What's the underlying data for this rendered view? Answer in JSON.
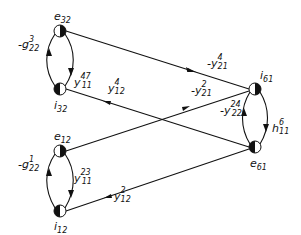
{
  "diagram": {
    "type": "signal-flow-graph",
    "nodes": [
      {
        "id": "e32",
        "label": "e",
        "sub": "32",
        "x": 60,
        "y": 31,
        "filled_half": "right"
      },
      {
        "id": "i32",
        "label": "i",
        "sub": "32",
        "x": 60,
        "y": 89,
        "filled_half": "left"
      },
      {
        "id": "e12",
        "label": "e",
        "sub": "12",
        "x": 60,
        "y": 151,
        "filled_half": "right"
      },
      {
        "id": "i12",
        "label": "i",
        "sub": "12",
        "x": 60,
        "y": 211,
        "filled_half": "left"
      },
      {
        "id": "i61",
        "label": "i",
        "sub": "61",
        "x": 255,
        "y": 89,
        "filled_half": "right"
      },
      {
        "id": "e61",
        "label": "e",
        "sub": "61",
        "x": 255,
        "y": 147,
        "filled_half": "left"
      }
    ],
    "edges": [
      {
        "from": "i32",
        "to": "e32",
        "gain": "-g",
        "sup": "3",
        "sub": "22"
      },
      {
        "from": "e32",
        "to": "i32",
        "gain": "y",
        "sup": "47",
        "sub": "11"
      },
      {
        "from": "i12",
        "to": "e12",
        "gain": "-g",
        "sup": "1",
        "sub": "22"
      },
      {
        "from": "e12",
        "to": "i12",
        "gain": "y",
        "sup": "23",
        "sub": "11"
      },
      {
        "from": "e61",
        "to": "i61",
        "gain": "-y",
        "sup": "24",
        "sub": "22"
      },
      {
        "from": "i61",
        "to": "e61",
        "gain": "h",
        "sup": "6",
        "sub": "11"
      },
      {
        "from": "e32",
        "to": "i61",
        "gain": "-y",
        "sup": "4",
        "sub": "21"
      },
      {
        "from": "e12",
        "to": "i61",
        "gain": "-y",
        "sup": "2",
        "sub": "21"
      },
      {
        "from": "e61",
        "to": "i32",
        "gain": "y",
        "sup": "4",
        "sub": "12"
      },
      {
        "from": "e61",
        "to": "i12",
        "gain": "y",
        "sup": "2",
        "sub": "12"
      }
    ]
  },
  "labels": {
    "n_e32": {
      "main": "e",
      "sub": "32"
    },
    "n_i32": {
      "main": "i",
      "sub": "32"
    },
    "n_e12": {
      "main": "e",
      "sub": "12"
    },
    "n_i12": {
      "main": "i",
      "sub": "12"
    },
    "n_i61": {
      "main": "i",
      "sub": "61"
    },
    "n_e61": {
      "main": "e",
      "sub": "61"
    },
    "g22_3": {
      "main": "-g",
      "sup": "3",
      "sub": "22"
    },
    "y11_47": {
      "main": "y",
      "sup": "47",
      "sub": "11"
    },
    "y12_4": {
      "main": "y",
      "sup": "4",
      "sub": "12"
    },
    "y21_4": {
      "main": "-y",
      "sup": "4",
      "sub": "21"
    },
    "y21_2": {
      "main": "-y",
      "sup": "2",
      "sub": "21"
    },
    "y22_24": {
      "main": "-y",
      "sup": "24",
      "sub": "22"
    },
    "h11_6": {
      "main": "h",
      "sup": "6",
      "sub": "11"
    },
    "g22_1": {
      "main": "-g",
      "sup": "1",
      "sub": "22"
    },
    "y11_23": {
      "main": "y",
      "sup": "23",
      "sub": "11"
    },
    "y12_2": {
      "main": "y",
      "sup": "2",
      "sub": "12"
    }
  }
}
